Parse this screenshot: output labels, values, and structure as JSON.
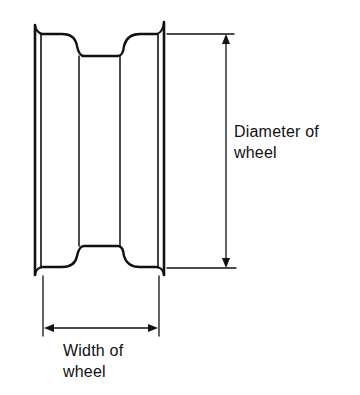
{
  "diagram": {
    "labels": {
      "diameter": {
        "line1": "Diameter of",
        "line2": "wheel"
      },
      "width": {
        "line1": "Width of",
        "line2": "wheel"
      }
    },
    "colors": {
      "stroke": "#111111",
      "background": "#ffffff"
    }
  }
}
